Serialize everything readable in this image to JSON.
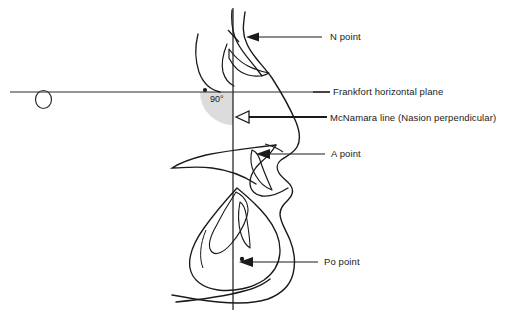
{
  "figure": {
    "kind": "cephalometric-profile-tracing",
    "background": "#ffffff",
    "ink": "#1a1a1a",
    "shade": "#dcdcdc",
    "width": 521,
    "height": 318
  },
  "annotations": {
    "angle_label": "90°",
    "labels": [
      {
        "id": "n-point",
        "text": "N point",
        "x": 330,
        "y": 32
      },
      {
        "id": "fhp",
        "text": "Frankfort horizontal plane",
        "x": 333,
        "y": 87
      },
      {
        "id": "mcnamara",
        "text": "McNamara line (Nasion perpendicular)",
        "x": 330,
        "y": 113
      },
      {
        "id": "a-point",
        "text": "A point",
        "x": 331,
        "y": 149
      },
      {
        "id": "po-point",
        "text": "Po point",
        "x": 324,
        "y": 257
      }
    ]
  },
  "landmarks": {
    "n_point": {
      "name": "N point",
      "desc": "Nasion"
    },
    "a_point": {
      "name": "A point",
      "desc": "Subspinale"
    },
    "po_point": {
      "name": "Po point",
      "desc": "Pogonion"
    }
  },
  "reference_lines": {
    "frankfort_horizontal": {
      "label": "Frankfort horizontal plane",
      "y": 92,
      "x1": 10,
      "x2": 330
    },
    "nasion_perpendicular": {
      "label": "McNamara line (Nasion perpendicular)",
      "x": 233,
      "y1": 8,
      "y2": 310
    },
    "angle_between": "90°"
  }
}
